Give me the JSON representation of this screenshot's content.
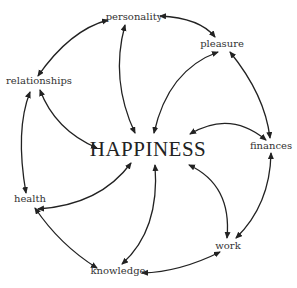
{
  "diagram": {
    "center": {
      "label": "HAPPINESS",
      "x": 148,
      "y": 155
    },
    "nodes": [
      {
        "id": "personality",
        "label": "personality",
        "x": 134,
        "y": 20
      },
      {
        "id": "pleasure",
        "label": "pleasure",
        "x": 222,
        "y": 47
      },
      {
        "id": "relationships",
        "label": "relationships",
        "x": 39,
        "y": 84
      },
      {
        "id": "finances",
        "label": "finances",
        "x": 270,
        "y": 149
      },
      {
        "id": "health",
        "label": "health",
        "x": 30,
        "y": 202
      },
      {
        "id": "work",
        "label": "work",
        "x": 228,
        "y": 249
      },
      {
        "id": "knowledge",
        "label": "knowledge",
        "x": 118,
        "y": 274
      }
    ],
    "edges": [
      [
        "personality",
        "pleasure"
      ],
      [
        "pleasure",
        "finances"
      ],
      [
        "finances",
        "work"
      ],
      [
        "work",
        "knowledge"
      ],
      [
        "knowledge",
        "health"
      ],
      [
        "health",
        "relationships"
      ],
      [
        "relationships",
        "personality"
      ],
      [
        "personality",
        "HAPPINESS"
      ],
      [
        "pleasure",
        "HAPPINESS"
      ],
      [
        "finances",
        "HAPPINESS"
      ],
      [
        "work",
        "HAPPINESS"
      ],
      [
        "knowledge",
        "HAPPINESS"
      ],
      [
        "health",
        "HAPPINESS"
      ],
      [
        "relationships",
        "HAPPINESS"
      ]
    ],
    "edge_style": "curved double-headed arrows",
    "colors": {
      "stroke": "#222222",
      "text": "#333333"
    }
  }
}
